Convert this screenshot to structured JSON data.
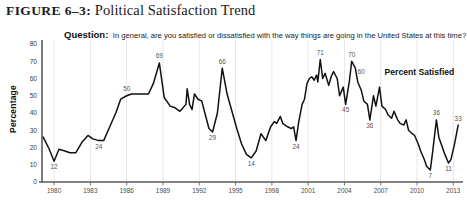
{
  "figure": {
    "number": "FIGURE 6–3",
    "separator": ":",
    "name": "Political Satisfaction Trend"
  },
  "question": {
    "label": "Question:",
    "text": "In general, are you satisfied or dissatisfied with the way things are going in the United States at this time?"
  },
  "colors": {
    "line": "#111111",
    "grid": "#dcdcde",
    "axis": "#5a5a5a",
    "label": "#555555",
    "background": "#ffffff"
  },
  "chart_data": {
    "type": "line",
    "title": "Political Satisfaction Trend",
    "xlabel": "",
    "ylabel": "Percentage",
    "ylim": [
      0,
      80
    ],
    "ytick_step": 10,
    "yticks": [
      0,
      10,
      20,
      30,
      40,
      50,
      60,
      70,
      80
    ],
    "xlim": [
      1979,
      2013.8
    ],
    "xticks": [
      1980,
      1983,
      1986,
      1989,
      1992,
      1995,
      1998,
      2001,
      2004,
      2007,
      2010,
      2013
    ],
    "xtick_labels": [
      "1980",
      "1983",
      "1986",
      "1989",
      "1992",
      "1995",
      "1998",
      "2001",
      "2004",
      "2007",
      "2010",
      "2013"
    ],
    "grid": "vertical",
    "legend": "none",
    "series": [
      {
        "name": "Percent Satisfied",
        "annotation": "Percent Satisfied",
        "annotation_x": 2010.2,
        "annotation_y": 62,
        "x": [
          1979.1,
          1979.6,
          1980.0,
          1980.4,
          1980.9,
          1981.3,
          1981.8,
          1982.3,
          1982.8,
          1983.2,
          1983.7,
          1984.1,
          1984.6,
          1985.1,
          1985.5,
          1986.0,
          1986.4,
          1986.9,
          1987.3,
          1987.8,
          1988.2,
          1988.7,
          1989.1,
          1989.6,
          1990.0,
          1990.4,
          1990.9,
          1991.0,
          1991.2,
          1991.4,
          1991.6,
          1991.9,
          1992.2,
          1992.5,
          1992.8,
          1993.1,
          1993.5,
          1993.9,
          1994.3,
          1994.7,
          1995.1,
          1995.5,
          1995.9,
          1996.3,
          1996.7,
          1997.1,
          1997.5,
          1997.9,
          1998.2,
          1998.4,
          1998.7,
          1998.9,
          1999.1,
          1999.3,
          1999.6,
          1999.8,
          2000.0,
          2000.2,
          2000.5,
          2000.7,
          2000.9,
          2001.1,
          2001.3,
          2001.5,
          2001.7,
          2001.8,
          2002.0,
          2002.2,
          2002.4,
          2002.7,
          2002.9,
          2003.1,
          2003.4,
          2003.6,
          2003.9,
          2004.1,
          2004.4,
          2004.6,
          2004.9,
          2005.1,
          2005.4,
          2005.6,
          2005.9,
          2006.1,
          2006.4,
          2006.6,
          2006.9,
          2007.1,
          2007.4,
          2007.6,
          2007.9,
          2008.1,
          2008.4,
          2008.6,
          2008.9,
          2009.1,
          2009.3,
          2009.6,
          2009.8,
          2010.1,
          2010.3,
          2010.6,
          2010.8,
          2011.1,
          2011.3,
          2011.6,
          2011.8,
          2012.1,
          2012.3,
          2012.6,
          2012.8,
          2013.1,
          2013.4
        ],
        "y": [
          26,
          19,
          12,
          19,
          18,
          17,
          17,
          23,
          27,
          25,
          24,
          24,
          32,
          40,
          48,
          50,
          51,
          51,
          51,
          51,
          57,
          69,
          49,
          44,
          43,
          41,
          45,
          54,
          45,
          42,
          51,
          48,
          47,
          39,
          31,
          29,
          40,
          66,
          51,
          41,
          31,
          22,
          16,
          14,
          18,
          28,
          24,
          32,
          35,
          34,
          38,
          34,
          33,
          32,
          31,
          32,
          24,
          34,
          45,
          48,
          57,
          60,
          61,
          59,
          62,
          58,
          71,
          60,
          63,
          56,
          61,
          64,
          60,
          50,
          55,
          45,
          58,
          70,
          66,
          58,
          53,
          47,
          45,
          36,
          50,
          44,
          55,
          44,
          42,
          39,
          37,
          41,
          36,
          34,
          33,
          36,
          30,
          28,
          27,
          22,
          18,
          13,
          9,
          7,
          18,
          36,
          26,
          20,
          16,
          11,
          13,
          22,
          33
        ],
        "point_labels": [
          {
            "x": 1980.0,
            "y": 12,
            "text": "12",
            "pos": "below"
          },
          {
            "x": 1983.7,
            "y": 24,
            "text": "24",
            "pos": "below"
          },
          {
            "x": 1986.0,
            "y": 50,
            "text": "50",
            "pos": "above"
          },
          {
            "x": 1988.7,
            "y": 69,
            "text": "69",
            "pos": "above"
          },
          {
            "x": 1993.1,
            "y": 29,
            "text": "29",
            "pos": "below"
          },
          {
            "x": 1993.9,
            "y": 66,
            "text": "66",
            "pos": "above"
          },
          {
            "x": 1996.3,
            "y": 14,
            "text": "14",
            "pos": "below"
          },
          {
            "x": 2000.0,
            "y": 24,
            "text": "24",
            "pos": "below"
          },
          {
            "x": 2002.0,
            "y": 71,
            "text": "71",
            "pos": "above"
          },
          {
            "x": 2004.1,
            "y": 45,
            "text": "45",
            "pos": "below"
          },
          {
            "x": 2004.6,
            "y": 70,
            "text": "70",
            "pos": "above"
          },
          {
            "x": 2006.1,
            "y": 36,
            "text": "36",
            "pos": "below"
          },
          {
            "x": 2005.4,
            "y": 60,
            "text": "60",
            "pos": "above"
          },
          {
            "x": 2011.1,
            "y": 7,
            "text": "7",
            "pos": "below"
          },
          {
            "x": 2011.6,
            "y": 36,
            "text": "36",
            "pos": "above"
          },
          {
            "x": 2012.6,
            "y": 11,
            "text": "11",
            "pos": "below"
          },
          {
            "x": 2013.4,
            "y": 33,
            "text": "33",
            "pos": "above"
          }
        ]
      }
    ]
  }
}
